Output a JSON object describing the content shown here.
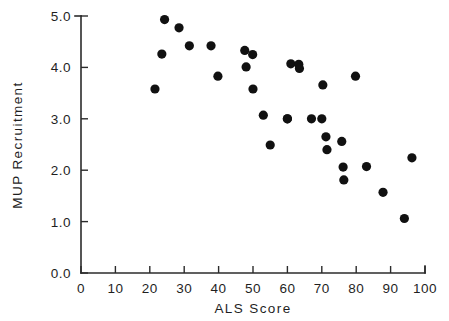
{
  "chart_data": {
    "type": "scatter",
    "title": "",
    "xlabel": "ALS  Score",
    "ylabel": "MUP  Recruitment",
    "xlim": [
      0,
      100
    ],
    "ylim": [
      0.0,
      5.0
    ],
    "grid": false,
    "legend": null,
    "marker": {
      "shape": "circle",
      "color": "#111111",
      "size_px": 4.6
    },
    "xticks": [
      0,
      10,
      20,
      30,
      40,
      50,
      60,
      70,
      80,
      90,
      100
    ],
    "xtick_labels": [
      "0",
      "10",
      "20",
      "30",
      "40",
      "50",
      "60",
      "70",
      "80",
      "90",
      "100"
    ],
    "yticks": [
      0.0,
      1.0,
      2.0,
      3.0,
      4.0,
      5.0
    ],
    "ytick_labels": [
      "0.0",
      "1.0",
      "2.0",
      "3.0",
      "4.0",
      "5.0"
    ],
    "n_points": 31,
    "points": [
      {
        "x": 21.5,
        "y": 3.58
      },
      {
        "x": 23.5,
        "y": 4.26
      },
      {
        "x": 24.3,
        "y": 4.93
      },
      {
        "x": 28.5,
        "y": 4.77
      },
      {
        "x": 31.5,
        "y": 4.42
      },
      {
        "x": 37.8,
        "y": 4.42
      },
      {
        "x": 39.8,
        "y": 3.83
      },
      {
        "x": 47.6,
        "y": 4.33
      },
      {
        "x": 48.0,
        "y": 4.01
      },
      {
        "x": 49.9,
        "y": 4.25
      },
      {
        "x": 50.0,
        "y": 3.58
      },
      {
        "x": 53.0,
        "y": 3.07
      },
      {
        "x": 55.0,
        "y": 2.49
      },
      {
        "x": 60.0,
        "y": 3.0
      },
      {
        "x": 61.0,
        "y": 4.07
      },
      {
        "x": 63.3,
        "y": 4.06
      },
      {
        "x": 63.5,
        "y": 3.98
      },
      {
        "x": 67.0,
        "y": 3.0
      },
      {
        "x": 70.0,
        "y": 3.0
      },
      {
        "x": 70.3,
        "y": 3.66
      },
      {
        "x": 71.2,
        "y": 2.65
      },
      {
        "x": 71.5,
        "y": 2.4
      },
      {
        "x": 75.8,
        "y": 2.56
      },
      {
        "x": 76.2,
        "y": 2.06
      },
      {
        "x": 76.4,
        "y": 1.81
      },
      {
        "x": 79.8,
        "y": 3.83
      },
      {
        "x": 83.0,
        "y": 2.07
      },
      {
        "x": 87.8,
        "y": 1.57
      },
      {
        "x": 94.0,
        "y": 1.06
      },
      {
        "x": 96.2,
        "y": 2.24
      },
      {
        "x": 60.0,
        "y": 3.0
      }
    ]
  },
  "axes": {
    "x_axis_name": "ALS Score axis",
    "y_axis_name": "MUP Recruitment axis"
  }
}
